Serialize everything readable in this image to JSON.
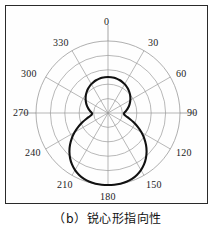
{
  "caption": "（b）锐心形指向性",
  "figure": {
    "border_color": "#2a2a2a",
    "grid_color": "#9a9a9a",
    "curve_color": "#111111",
    "label_color": "#1c1c1c"
  },
  "labels": {
    "a0": "0",
    "a30": "30",
    "a60": "60",
    "a90": "90",
    "a120": "120",
    "a150": "150",
    "a180": "180",
    "a210": "210",
    "a240": "240",
    "a270": "270",
    "a300": "300",
    "a330": "330"
  },
  "chart_data": {
    "type": "line",
    "subtype": "polar",
    "title": "（b）锐心形指向性",
    "xlabel": "",
    "ylabel": "",
    "angle_unit": "degrees",
    "angle_origin": "top",
    "angle_direction": "clockwise",
    "grid": true,
    "grid_circles": 5,
    "radial_ticks": [
      0.2,
      0.4,
      0.6,
      0.8,
      1.0
    ],
    "angular_ticks": [
      0,
      30,
      60,
      90,
      120,
      150,
      180,
      210,
      240,
      270,
      300,
      330
    ],
    "tick_labels": [
      "0",
      "30",
      "60",
      "90",
      "120",
      "150",
      "180",
      "210",
      "240",
      "270",
      "300",
      "330"
    ],
    "rlim": [
      0,
      1
    ],
    "legend": null,
    "series": [
      {
        "name": "锐心形指向性",
        "angles": [
          0,
          5,
          10,
          15,
          20,
          25,
          30,
          35,
          40,
          45,
          50,
          55,
          60,
          65,
          70,
          75,
          80,
          85,
          90,
          95,
          100,
          105,
          110,
          115,
          120,
          125,
          130,
          135,
          140,
          145,
          150,
          155,
          160,
          165,
          170,
          175,
          180,
          185,
          190,
          195,
          200,
          205,
          210,
          215,
          220,
          225,
          230,
          235,
          240,
          245,
          250,
          255,
          260,
          265,
          270,
          275,
          280,
          285,
          290,
          295,
          300,
          305,
          310,
          315,
          320,
          325,
          330,
          335,
          340,
          345,
          350,
          355
        ],
        "values": [
          0.5,
          0.499,
          0.496,
          0.491,
          0.484,
          0.474,
          0.463,
          0.449,
          0.434,
          0.417,
          0.399,
          0.379,
          0.358,
          0.336,
          0.314,
          0.291,
          0.268,
          0.245,
          0.224,
          0.225,
          0.256,
          0.31,
          0.379,
          0.456,
          0.536,
          0.614,
          0.689,
          0.758,
          0.819,
          0.872,
          0.915,
          0.949,
          0.974,
          0.989,
          0.997,
          1.0,
          1.0,
          1.0,
          0.997,
          0.989,
          0.974,
          0.949,
          0.915,
          0.872,
          0.819,
          0.758,
          0.689,
          0.614,
          0.536,
          0.456,
          0.379,
          0.31,
          0.256,
          0.225,
          0.224,
          0.245,
          0.268,
          0.291,
          0.314,
          0.336,
          0.358,
          0.379,
          0.399,
          0.417,
          0.434,
          0.449,
          0.463,
          0.474,
          0.484,
          0.491,
          0.496,
          0.499
        ]
      }
    ]
  }
}
